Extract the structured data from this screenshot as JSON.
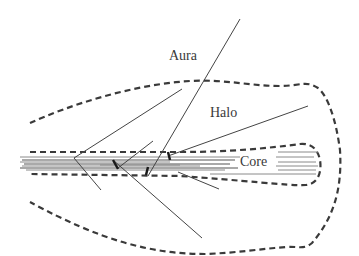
{
  "diagram": {
    "type": "schematic of nested regions with radiating lines",
    "labels": {
      "aura": "Aura",
      "halo": "Halo",
      "core": "Core"
    },
    "regions": [
      {
        "name": "Aura",
        "description": "outer region beyond the dashed halo boundary"
      },
      {
        "name": "Halo",
        "description": "large dashed envelope, tapered toward left, rounded on right"
      },
      {
        "name": "Core",
        "description": "narrow dashed tube containing a bundle of parallel fibers"
      }
    ],
    "colors": {
      "line": "#3a3a3a",
      "fiber": "#8a8a8a",
      "background": "#ffffff"
    }
  }
}
